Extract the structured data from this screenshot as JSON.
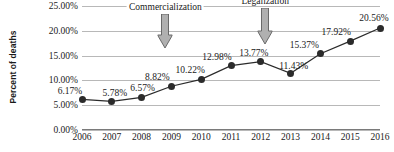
{
  "chart_data": {
    "type": "line",
    "title": "",
    "xlabel": "",
    "ylabel": "Percent of deaths",
    "categories": [
      "2006",
      "2007",
      "2008",
      "2009",
      "2010",
      "2011",
      "2012",
      "2013",
      "2014",
      "2015",
      "2016"
    ],
    "values": [
      6.17,
      5.78,
      6.57,
      8.82,
      10.22,
      12.98,
      13.77,
      11.43,
      15.37,
      17.92,
      20.56
    ],
    "point_labels": [
      "6.17%",
      "5.78%",
      "6.57%",
      "8.82%",
      "10.22%",
      "12.98%",
      "13.77%",
      "11.43%",
      "15.37%",
      "17.92%",
      "20.56%"
    ],
    "ylim": [
      0,
      25
    ],
    "ytick_values": [
      0,
      5,
      10,
      15,
      20,
      25
    ],
    "ytick_labels": [
      "0.00%",
      "5.00%",
      "10.00%",
      "15.00%",
      "20.00%",
      "25.00%"
    ],
    "grid": true,
    "legend": false,
    "series_color": "#2b2b2b",
    "grid_color": "#b8b8b8",
    "annotations": [
      {
        "label": "Commercialization",
        "at_year": "2009",
        "label_x_pct": 28.0,
        "arrow_x_pct": 28.0
      },
      {
        "label": "Legalization",
        "at_year": "2013",
        "label_x_pct": 61.5,
        "arrow_x_pct": 61.5
      }
    ]
  },
  "annotation_arrow": {
    "fill": "#b0b0b0",
    "stroke": "#5e5e5e"
  }
}
